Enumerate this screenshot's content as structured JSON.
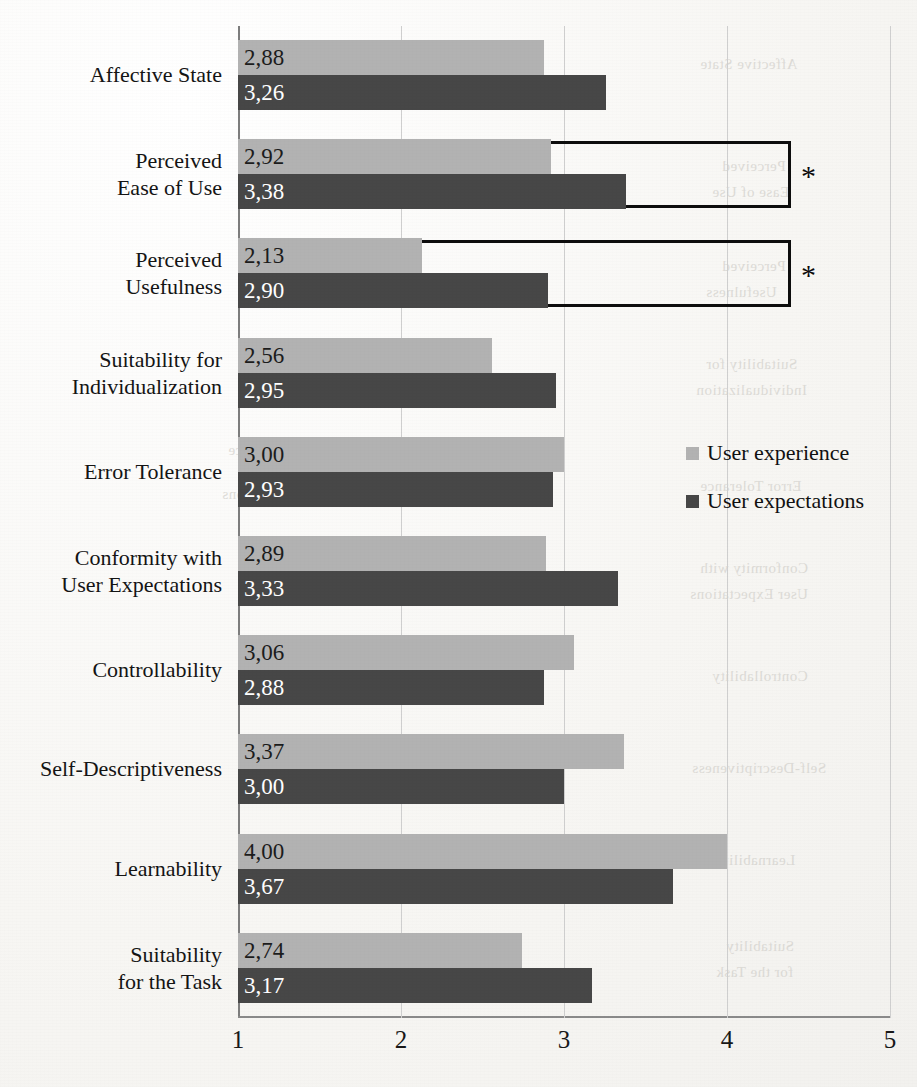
{
  "chart_data": {
    "type": "bar",
    "orientation": "horizontal",
    "title": "",
    "xlabel": "",
    "ylabel": "",
    "xlim": [
      1,
      5
    ],
    "xticks": [
      "1",
      "2",
      "3",
      "4",
      "5"
    ],
    "grid": true,
    "legend_position": "right-middle",
    "categories": [
      "Affective State",
      "Perceived\nEase of Use",
      "Perceived\nUsefulness",
      "Suitability for\nIndividualization",
      "Error Tolerance",
      "Conformity with\nUser Expectations",
      "Controllability",
      "Self-Descriptiveness",
      "Learnability",
      "Suitability\nfor the Task"
    ],
    "series": [
      {
        "name": "User experience",
        "color": "#b2b2b2",
        "values": [
          2.88,
          2.92,
          2.13,
          2.56,
          3.0,
          2.89,
          3.06,
          3.37,
          4.0,
          2.74
        ],
        "labels": [
          "2,88",
          "2,92",
          "2,13",
          "2,56",
          "3,00",
          "2,89",
          "3,06",
          "3,37",
          "4,00",
          "2,74"
        ]
      },
      {
        "name": "User expectations",
        "color": "#474747",
        "values": [
          3.26,
          3.38,
          2.9,
          2.95,
          2.93,
          3.33,
          2.88,
          3.0,
          3.67,
          3.17
        ],
        "labels": [
          "3,26",
          "3,38",
          "2,90",
          "2,95",
          "2,93",
          "3,33",
          "2,88",
          "3,00",
          "3,67",
          "3,17"
        ]
      }
    ],
    "annotations": [
      {
        "category": "Perceived Ease of Use",
        "marker": "*",
        "note": "significance bracket"
      },
      {
        "category": "Perceived Usefulness",
        "marker": "*",
        "note": "significance bracket"
      }
    ]
  },
  "legend": {
    "items": [
      {
        "label": "User experience",
        "color": "#b2b2b2"
      },
      {
        "label": "User expectations",
        "color": "#474747"
      }
    ]
  },
  "ghosts": [
    "Affective State",
    "Perceived",
    "Ease of Use",
    "Perceived",
    "Usefulness",
    "Suitability for",
    "Individualization",
    "User experience",
    "Error Tolerance",
    "User expectations",
    "Conformity with",
    "User Expectations",
    "Controllability",
    "Self-Descriptiveness",
    "Learnability",
    "Suitability",
    "for the Task"
  ]
}
